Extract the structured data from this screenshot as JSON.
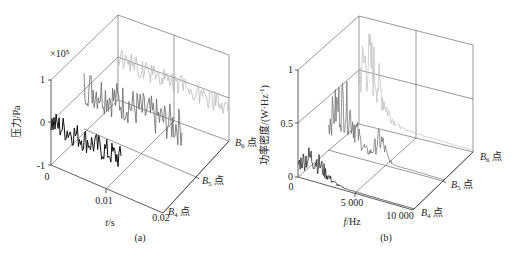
{
  "chart_data": [
    {
      "type": "line",
      "subtype": "3d-waterfall",
      "panel_label": "(a)",
      "title": "",
      "xlabel": "t/s",
      "ylabel": "压力/Pa",
      "zlabel": "",
      "y_exponent": "×10⁵",
      "x_ticks": [
        "0",
        "0.01",
        "0.02"
      ],
      "y_ticks": [
        "-1",
        "0",
        "1"
      ],
      "z_ticks": [
        "B₄ 点",
        "B₅ 点",
        "B₆ 点"
      ],
      "xlim": [
        0,
        0.02
      ],
      "ylim": [
        -1,
        1
      ],
      "grid": true,
      "series": [
        {
          "name": "B₄ 点",
          "color": "#111111",
          "description": "pressure fluctuation about 0, amplitude ~±0.3×10⁵ Pa, slight downward drift",
          "x_range": [
            0,
            0.0125
          ]
        },
        {
          "name": "B₅ 点",
          "color": "#666666",
          "description": "pressure fluctuation, amplitude ~±0.5×10⁵ Pa, peak near 0.6×10⁵",
          "x_range": [
            0,
            0.0175
          ]
        },
        {
          "name": "B₆ 点",
          "color": "#bbbbbb",
          "description": "pressure fluctuation, mean ~0, spikes down to ~-0.7×10⁵ Pa",
          "x_range": [
            0,
            0.02
          ]
        }
      ]
    },
    {
      "type": "line",
      "subtype": "3d-waterfall",
      "panel_label": "(b)",
      "title": "",
      "xlabel": "f/Hz",
      "ylabel": "功率密度/(W·Hz⁻¹)",
      "zlabel": "",
      "x_ticks": [
        "0",
        "5 000",
        "10 000"
      ],
      "y_ticks": [
        "0",
        "0.5",
        "1"
      ],
      "z_ticks": [
        "B₄ 点",
        "B₅ 点",
        "B₆ 点"
      ],
      "xlim": [
        0,
        10000
      ],
      "ylim": [
        0,
        1
      ],
      "grid": true,
      "series": [
        {
          "name": "B₄ 点",
          "color": "#111111",
          "peak_value": 0.3,
          "peak_freq_hz": 1200,
          "description": "spectrum concentrated below ~4000 Hz, peaks ~0.3"
        },
        {
          "name": "B₅ 点",
          "color": "#666666",
          "peak_value": 0.65,
          "peak_freq_hz": 1300,
          "description": "spectrum peaks ~0.65 around 1000-1500 Hz, secondary ~0.3 near 4500 Hz"
        },
        {
          "name": "B₆ 点",
          "color": "#bbbbbb",
          "peak_value": 0.8,
          "peak_freq_hz": 900,
          "description": "spectrum peaks ~0.8 at low frequency, broadband up to ~4000 Hz"
        }
      ]
    }
  ],
  "panels": {
    "a": {
      "caption": "(a)",
      "ylabel": "压力/Pa",
      "exponent": "×10⁵",
      "yticks": {
        "top": "1",
        "mid": "0",
        "bot": "-1"
      },
      "xticks": {
        "t0": "0",
        "t1": "0.01",
        "t2": "0.02"
      },
      "xlabel_t": "t",
      "xlabel_unit": "/s",
      "depth": {
        "b4": "4",
        "b5": "5",
        "b6": "6",
        "prefix": "B",
        "suffix": "点"
      }
    },
    "b": {
      "caption": "(b)",
      "ylabel": "功率密度/(W·Hz",
      "ylabel_sup": "-1",
      "ylabel_end": ")",
      "yticks": {
        "top": "1",
        "mid": "0.5",
        "bot": "0"
      },
      "xticks": {
        "f0": "0",
        "f1": "5 000",
        "f2": "10 000"
      },
      "xlabel_f": "f",
      "xlabel_unit": "/Hz",
      "depth": {
        "b4": "4",
        "b5": "5",
        "b6": "6",
        "prefix": "B",
        "suffix": "点"
      }
    }
  }
}
